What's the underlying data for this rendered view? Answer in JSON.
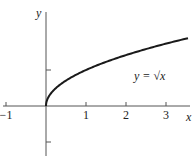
{
  "chart_data": {
    "type": "line",
    "title": "",
    "function": "y = sqrt(x)",
    "annotation": "y = √x",
    "xlabel": "x",
    "ylabel": "y",
    "xlim": [
      -1.1,
      3.6
    ],
    "ylim": [
      -1.3,
      2.6
    ],
    "x_ticks": [
      -1,
      1,
      2,
      3
    ],
    "x_tick_labels": [
      "−1",
      "1",
      "2",
      "3"
    ],
    "y_ticks": [
      1,
      -1
    ],
    "y_tick_labels": [],
    "grid": false,
    "legend": "none",
    "series": [
      {
        "name": "y = √x",
        "x": [
          0,
          0.1,
          0.25,
          0.5,
          0.75,
          1,
          1.5,
          2,
          2.5,
          3,
          3.5
        ],
        "values": [
          0,
          0.316,
          0.5,
          0.707,
          0.866,
          1,
          1.225,
          1.414,
          1.581,
          1.732,
          1.871
        ]
      }
    ],
    "color": "#1a1a1a"
  }
}
